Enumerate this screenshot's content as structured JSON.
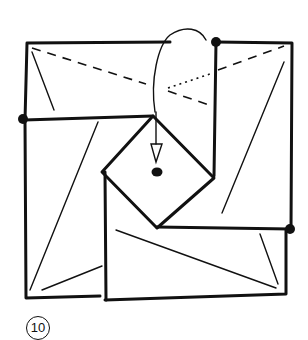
{
  "diagram": {
    "type": "origami-fold-step",
    "step_number": "10",
    "stroke_color": "#111111",
    "background": "#ffffff",
    "elements": [
      "outer-square",
      "folded-flaps",
      "center-diamond",
      "curved-fold-arrow",
      "reference-dots",
      "dashed-valley-fold",
      "dotted-hidden-line"
    ]
  }
}
